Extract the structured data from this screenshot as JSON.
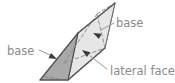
{
  "figure": {
    "name": "triangular-prism-diagram",
    "background_color": "#ffffff"
  },
  "solid": {
    "type": "triangular-prism",
    "faces": {
      "front_base_triangle": {
        "label": "base",
        "fill": "#a9a9a9",
        "stroke": "#4d4d4d",
        "points": "40,80 78,33 68,80"
      },
      "lateral_face_top": {
        "label": "lateral face",
        "fill": "#e6e6e6",
        "stroke": "#6e6e6e",
        "points": "78,33 115,3 105,48 68,80"
      },
      "back_base_triangle": {
        "label": "base",
        "fill": "#ededed",
        "stroke": "#7a7a7a",
        "points": "115,3 105,48 78,33"
      }
    },
    "hidden_edges": [
      {
        "name": "hidden-edge-vertical",
        "points": "105,48 97,14"
      },
      {
        "name": "hidden-edge-left",
        "points": "97,14 64,63"
      },
      {
        "name": "hidden-edge-right",
        "points": "97,14 115,3"
      },
      {
        "name": "hidden-edge-base-back",
        "points": "64,63 105,48"
      },
      {
        "name": "hidden-edge-front-bottom",
        "points": "45,77 68,80"
      }
    ]
  },
  "labels": [
    {
      "id": "base-left",
      "text": "base",
      "text_x": 7,
      "text_y": 55,
      "color": "#8a8a8a",
      "leader": "39,50 52,56",
      "arrow_tip": "57,59",
      "arrow_angle": 205
    },
    {
      "id": "base-right",
      "text": "base",
      "text_x": 116,
      "text_y": 27,
      "color": "#8a8a8a",
      "leader": "114,23 101,30",
      "arrow_tip": "93,33",
      "arrow_angle": 25
    },
    {
      "id": "lateral-face",
      "text": "lateral face",
      "text_x": 110,
      "text_y": 75,
      "color": "#8a8a8a",
      "leader": "107,69 90,56",
      "arrow_tip": "82,50",
      "arrow_angle": 35
    }
  ],
  "colors": {
    "face_dark": "#a9a9a9",
    "face_light": "#e6e6e6",
    "face_mid": "#ededed",
    "outline": "#4d4d4d",
    "hidden_edge": "#8f8f8f",
    "leader_line": "#9a9a9a",
    "text": "#8a8a8a",
    "arrow": "#3a3a3a"
  }
}
